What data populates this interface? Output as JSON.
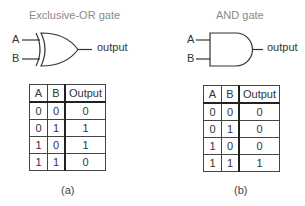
{
  "gates": [
    {
      "id": "xor",
      "title": "Exclusive-OR gate",
      "inputs": [
        "A",
        "B"
      ],
      "output_label": "output",
      "truth_table": {
        "headers": [
          "A",
          "B",
          "Output"
        ],
        "rows": [
          [
            "0",
            "0",
            "0"
          ],
          [
            "0",
            "1",
            "1"
          ],
          [
            "1",
            "0",
            "1"
          ],
          [
            "1",
            "1",
            "0"
          ]
        ]
      },
      "caption": "(a)"
    },
    {
      "id": "and",
      "title": "AND gate",
      "inputs": [
        "A",
        "B"
      ],
      "output_label": "output",
      "truth_table": {
        "headers": [
          "A",
          "B",
          "Output"
        ],
        "rows": [
          [
            "0",
            "0",
            "0"
          ],
          [
            "0",
            "1",
            "0"
          ],
          [
            "1",
            "0",
            "0"
          ],
          [
            "1",
            "1",
            "1"
          ]
        ]
      },
      "caption": "(b)"
    }
  ]
}
